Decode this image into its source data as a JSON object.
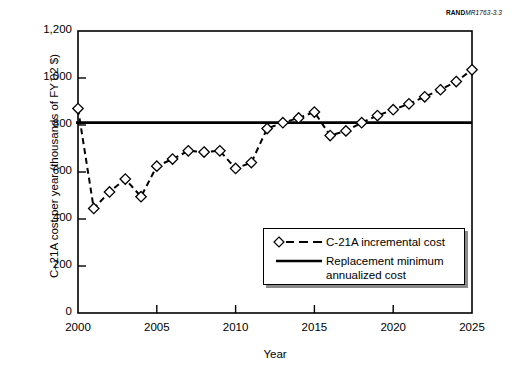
{
  "corner_id": {
    "bold": "RAND",
    "italic": "MR1763-3.3"
  },
  "chart_data": {
    "type": "line",
    "title": "",
    "xlabel": "Year",
    "ylabel": "C–21A cost per year (thousands of FY 02 $)",
    "xlim": [
      2000,
      2025
    ],
    "ylim": [
      0,
      1200
    ],
    "xticks": [
      2000,
      2005,
      2010,
      2015,
      2020,
      2025
    ],
    "xtick_labels": [
      "2000",
      "2005",
      "2010",
      "2015",
      "2020",
      "2025"
    ],
    "yticks": [
      0,
      200,
      400,
      600,
      800,
      1000,
      1200
    ],
    "ytick_labels": [
      "0",
      "200",
      "400",
      "600",
      "800",
      "1,000",
      "1,200"
    ],
    "grid": false,
    "legend_position": "lower right",
    "series": [
      {
        "name": "C-21A incremental cost",
        "marker": "diamond",
        "linestyle": "dashed",
        "color": "#000000",
        "x": [
          2000,
          2001,
          2002,
          2003,
          2004,
          2005,
          2006,
          2007,
          2008,
          2009,
          2010,
          2011,
          2012,
          2013,
          2014,
          2015,
          2016,
          2017,
          2018,
          2019,
          2020,
          2021,
          2022,
          2023,
          2024,
          2025
        ],
        "values": [
          870,
          445,
          515,
          570,
          495,
          625,
          655,
          690,
          685,
          690,
          615,
          640,
          785,
          810,
          830,
          855,
          755,
          775,
          810,
          840,
          865,
          890,
          920,
          950,
          985,
          1035
        ]
      },
      {
        "name": "Replacement minimum annualized cost",
        "marker": "none",
        "linestyle": "solid",
        "color": "#000000",
        "type": "hline",
        "value": 810
      }
    ],
    "legend": [
      {
        "label": "C-21A incremental cost",
        "marker": "diamond",
        "linestyle": "dashed"
      },
      {
        "label": "Replacement minimum",
        "label2": "annualized cost",
        "marker": "none",
        "linestyle": "solid"
      }
    ]
  },
  "colors": {
    "line": "#000000",
    "marker_fill": "#ffffff",
    "axis": "#000000",
    "background": "#ffffff",
    "legend_shadow": "#8a8a8a"
  }
}
